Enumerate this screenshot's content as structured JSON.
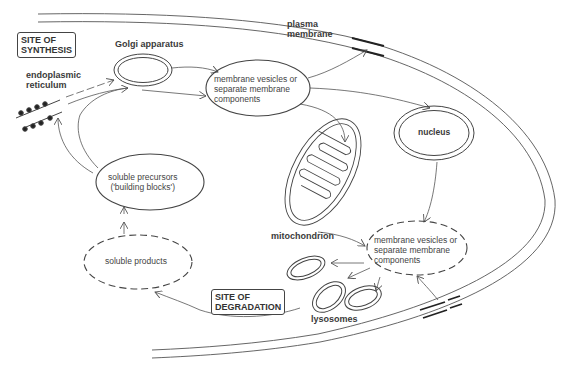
{
  "diagram": {
    "type": "cell-membrane-turnover",
    "boxes": {
      "site_synthesis": "SITE OF\nSYNTHESIS",
      "site_synthesis_l1": "SITE OF",
      "site_synthesis_l2": "SYNTHESIS",
      "site_degradation_l1": "SITE OF",
      "site_degradation_l2": "DEGRADATION"
    },
    "organelles": {
      "golgi": "Golgi apparatus",
      "er_l1": "endoplasmic",
      "er_l2": "reticulum",
      "plasma_l1": "plasma",
      "plasma_l2": "membrane",
      "nucleus": "nucleus",
      "mitochondrion": "mitochondrion",
      "lysosomes": "lysosomes"
    },
    "nodes": {
      "vesicles_top_l1": "membrane vesicles or",
      "vesicles_top_l2": "separate membrane",
      "vesicles_top_l3": "components",
      "vesicles_bottom_l1": "membrane vesicles or",
      "vesicles_bottom_l2": "separate membrane",
      "vesicles_bottom_l3": "components",
      "precursors_l1": "soluble precursors",
      "precursors_l2": "('building blocks')",
      "products": "soluble products"
    },
    "colors": {
      "line": "#555555",
      "text": "#333333",
      "background": "#ffffff"
    }
  }
}
